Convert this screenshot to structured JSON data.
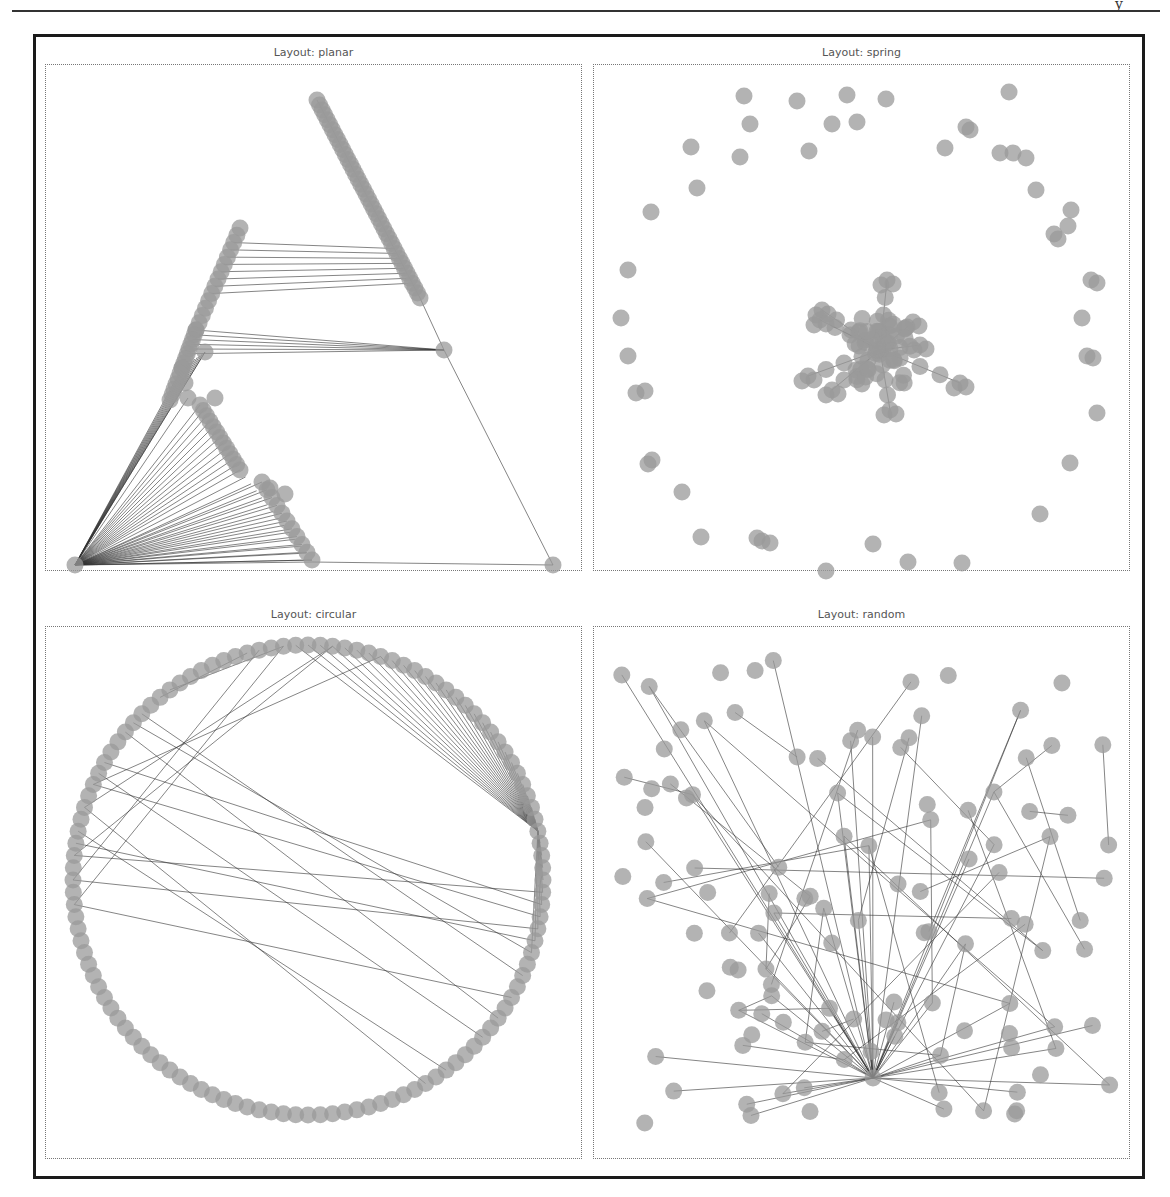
{
  "page": {
    "page_mark": "y"
  },
  "figure": {
    "panels": [
      {
        "id": "planar",
        "title": "Layout: planar"
      },
      {
        "id": "spring",
        "title": "Layout: spring"
      },
      {
        "id": "circular",
        "title": "Layout: circular"
      },
      {
        "id": "random",
        "title": "Layout: random"
      }
    ]
  },
  "style": {
    "node_color": "#9a9a9a",
    "edge_color": "#333333",
    "frame_color": "#1a1a1a"
  },
  "chart_data": [
    {
      "type": "network",
      "title": "Layout: planar",
      "description": "Planar embedding: triangular outline with hub at bottom-left, long chain of nodes down the upper-right diagonal, ladder of parallel edges, fan of edges from bottom-left hub",
      "hub": [
        75,
        565
      ],
      "outer_triangle": [
        [
          75,
          565
        ],
        [
          317,
          100
        ],
        [
          553,
          565
        ]
      ]
    },
    {
      "type": "network",
      "title": "Layout: spring",
      "description": "Force-directed layout: dense star cluster at center with radiating spokes, isolated nodes arranged in a ring around the border",
      "center": [
        880,
        350
      ],
      "ring_node_count": 48
    },
    {
      "type": "network",
      "title": "Layout: circular",
      "description": "Circular layout: ~120 nodes on a circle, hub node on right side with many chords to the upper arc, several long chords crossing the circle",
      "center": [
        308,
        880
      ],
      "radius": 235,
      "hub_angle_deg": -12
    },
    {
      "type": "network",
      "title": "Layout: random",
      "description": "Random layout: ~120 nodes scattered uniformly, hub node near lower-center with many edges radiating outward",
      "hub": [
        873,
        1078
      ]
    }
  ]
}
